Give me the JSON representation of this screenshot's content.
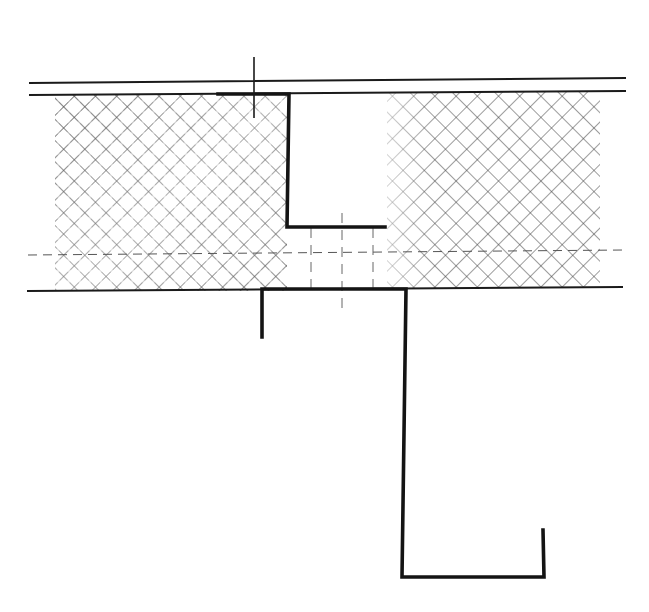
{
  "drawing": {
    "type": "section-detail",
    "description": "Sandwich panel joint section with insulation hatch and Z-profile",
    "colors": {
      "line": "#141414",
      "hatch_dark": "#3a3a3a",
      "hatch_light": "#9a9a9a",
      "background": "#ffffff",
      "dash": "#555555"
    },
    "panel": {
      "outer_line_top": {
        "x1": 30,
        "y1": 83,
        "x2": 625,
        "y2": 78
      },
      "outer_line_second": {
        "x1": 30,
        "y1": 95,
        "x2": 625,
        "y2": 91
      },
      "outer_line_bottom": {
        "x1": 28,
        "y1": 291,
        "x2": 622,
        "y2": 287
      },
      "center_dashed_line": {
        "x1": 28,
        "y1": 255,
        "x2": 625,
        "y2": 250
      }
    },
    "insulation_left": {
      "x": 55,
      "y": 95,
      "width": 232,
      "height": 196,
      "label": "insulation-hatch-left"
    },
    "insulation_right": {
      "x": 387,
      "y": 92,
      "width": 213,
      "height": 196,
      "label": "insulation-hatch-right"
    },
    "upper_profile": {
      "points": "218,94 289,94 287,227 385,227",
      "tick_mark": {
        "x1": 254,
        "y1": 57,
        "x2": 254,
        "y2": 118
      }
    },
    "lower_profile": {
      "points": "262,337 262,289 406,289 402,577 544,577 543,530"
    },
    "dashed_verticals": [
      {
        "x": 311,
        "y1": 228,
        "y2": 289
      },
      {
        "x": 342,
        "y1": 213,
        "y2": 313
      },
      {
        "x": 373,
        "y1": 228,
        "y2": 289
      }
    ]
  }
}
